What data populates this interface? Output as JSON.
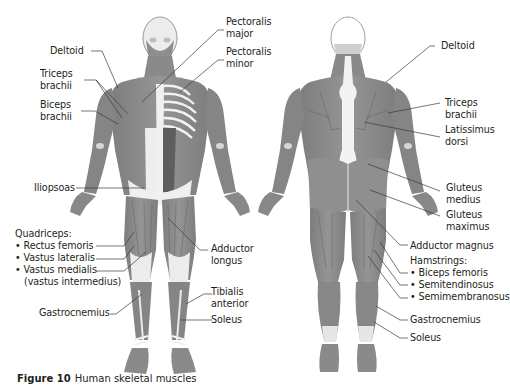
{
  "figure": {
    "caption_label": "Figure 10",
    "caption_text": "Human skeletal muscles",
    "colors": {
      "muscle": "#8c8c8c",
      "muscle_dark": "#6e6e6e",
      "tendon": "#e8e8e8",
      "leader_line": "#3a3a3a",
      "text": "#231f20"
    }
  },
  "anterior_view": {
    "labels": [
      {
        "id": "deltoid",
        "lines": [
          "Deltoid"
        ]
      },
      {
        "id": "triceps-brachii",
        "lines": [
          "Triceps",
          "brachii"
        ]
      },
      {
        "id": "biceps-brachii",
        "lines": [
          "Biceps",
          "brachii"
        ]
      },
      {
        "id": "pectoralis-major",
        "lines": [
          "Pectoralis",
          "major"
        ]
      },
      {
        "id": "pectoralis-minor",
        "lines": [
          "Pectoralis",
          "minor"
        ]
      },
      {
        "id": "iliopsoas",
        "lines": [
          "Iliopsoas"
        ]
      },
      {
        "id": "quadriceps",
        "lines": [
          "Quadriceps:",
          "• Rectus femoris",
          "• Vastus lateralis",
          "• Vastus medialis",
          "  (vastus intermedius)"
        ]
      },
      {
        "id": "adductor-longus",
        "lines": [
          "Adductor",
          "longus"
        ]
      },
      {
        "id": "tibialis-anterior",
        "lines": [
          "Tibialis",
          "anterior"
        ]
      },
      {
        "id": "gastrocnemius",
        "lines": [
          "Gastrocnemius"
        ]
      },
      {
        "id": "soleus",
        "lines": [
          "Soleus"
        ]
      }
    ]
  },
  "posterior_view": {
    "labels": [
      {
        "id": "deltoid",
        "lines": [
          "Deltoid"
        ]
      },
      {
        "id": "triceps-brachii",
        "lines": [
          "Triceps",
          "brachii"
        ]
      },
      {
        "id": "latissimus-dorsi",
        "lines": [
          "Latissimus",
          "dorsi"
        ]
      },
      {
        "id": "gluteus-medius",
        "lines": [
          "Gluteus",
          "medius"
        ]
      },
      {
        "id": "gluteus-maximus",
        "lines": [
          "Gluteus",
          "maximus"
        ]
      },
      {
        "id": "adductor-magnus",
        "lines": [
          "Adductor magnus"
        ]
      },
      {
        "id": "hamstrings",
        "lines": [
          "Hamstrings:",
          "• Biceps femoris",
          "• Semitendinosus",
          "• Semimembranosus"
        ]
      },
      {
        "id": "gastrocnemius",
        "lines": [
          "Gastrocnemius"
        ]
      },
      {
        "id": "soleus",
        "lines": [
          "Soleus"
        ]
      }
    ]
  }
}
